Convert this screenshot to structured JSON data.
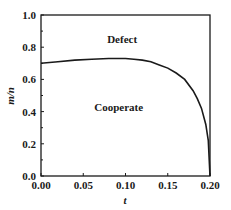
{
  "chart_data": {
    "type": "line",
    "title": "",
    "xlabel": "t",
    "ylabel": "m/n",
    "xlim": [
      0.0,
      0.2
    ],
    "ylim": [
      0.0,
      1.0
    ],
    "grid": false,
    "legend": null,
    "x_ticks": [
      "0.00",
      "0.05",
      "0.10",
      "0.15",
      "0.20"
    ],
    "y_ticks": [
      "0.0",
      "0.2",
      "0.4",
      "0.6",
      "0.8",
      "1.0"
    ],
    "series": [
      {
        "name": "boundary",
        "x": [
          0.0,
          0.02,
          0.04,
          0.06,
          0.08,
          0.09,
          0.1,
          0.11,
          0.12,
          0.13,
          0.14,
          0.15,
          0.16,
          0.17,
          0.18,
          0.185,
          0.19,
          0.195,
          0.198,
          0.2
        ],
        "y": [
          0.7,
          0.71,
          0.72,
          0.725,
          0.73,
          0.73,
          0.73,
          0.725,
          0.72,
          0.71,
          0.69,
          0.67,
          0.64,
          0.6,
          0.53,
          0.48,
          0.42,
          0.32,
          0.22,
          0.0
        ]
      }
    ],
    "annotations": [
      {
        "text": "Defect",
        "x": 0.096,
        "y": 0.85
      },
      {
        "text": "Cooperate",
        "x": 0.092,
        "y": 0.43
      }
    ]
  }
}
